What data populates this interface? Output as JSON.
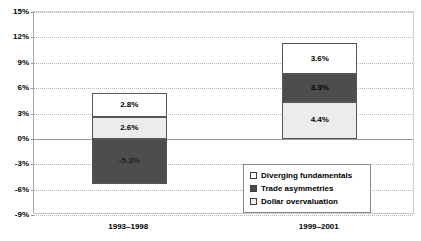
{
  "chart_data": {
    "type": "bar",
    "subtype": "stacked-bar-with-negative",
    "title": "",
    "subtitle": "",
    "xlabel": "",
    "ylabel": "",
    "categories": [
      "1993–1998",
      "1999–2001"
    ],
    "ylim": [
      -9,
      15
    ],
    "ytick_step": 3,
    "ytick_labels": [
      "15%",
      "12%",
      "9%",
      "6%",
      "3%",
      "0%",
      "-3%",
      "-6%",
      "-9%"
    ],
    "ytick_values": [
      15,
      12,
      9,
      6,
      3,
      0,
      -3,
      -6,
      -9
    ],
    "grid": true,
    "grid_style": "dotted",
    "legend_position": "inside-lower-right",
    "series": [
      {
        "name": "Diverging fundamentals",
        "color": "#ffffff",
        "values": [
          2.8,
          3.6
        ],
        "labels": [
          "2.8%",
          "3.6%"
        ]
      },
      {
        "name": "Trade asymmetries",
        "color": "#4d4d4d",
        "values": [
          -5.3,
          3.3
        ],
        "labels": [
          "-5.3%",
          "3.3%"
        ]
      },
      {
        "name": "Dollar overvaluation",
        "color": "#ececec",
        "values": [
          2.6,
          4.4
        ],
        "labels": [
          "2.6%",
          "4.4%"
        ]
      }
    ]
  },
  "legend": {
    "items": [
      {
        "label": "Diverging fundamentals",
        "color": "#ffffff"
      },
      {
        "label": "Trade asymmetries",
        "color": "#4d4d4d"
      },
      {
        "label": "Dollar overvaluation",
        "color": "#ececec"
      }
    ]
  },
  "axis": {
    "y_labels": [
      "15%",
      "12%",
      "9%",
      "6%",
      "3%",
      "0%",
      "-3%",
      "-6%",
      "-9%"
    ],
    "x_labels": [
      "1993–1998",
      "1999–2001"
    ]
  },
  "colors": {
    "plot_border": "#d0d0d0",
    "gridline": "#b5b5b5",
    "zero_line": "#9a9a9a",
    "bar_border": "#555555",
    "text": "#000000",
    "white_segment": "#ffffff",
    "light_segment": "#ececec",
    "dark_segment": "#4d4d4d"
  }
}
